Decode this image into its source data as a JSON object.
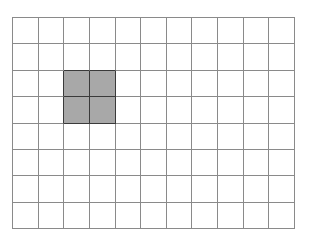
{
  "grid": {
    "columns": 11,
    "rows": 8,
    "line_color": "#8a8a8a",
    "empty_color": "#ffffff",
    "filled_color": "#a8a8a8",
    "filled_border_color": "#3a3a3a",
    "filled_cells": [
      {
        "row": 2,
        "col": 2
      },
      {
        "row": 2,
        "col": 3
      },
      {
        "row": 3,
        "col": 2
      },
      {
        "row": 3,
        "col": 3
      }
    ]
  }
}
